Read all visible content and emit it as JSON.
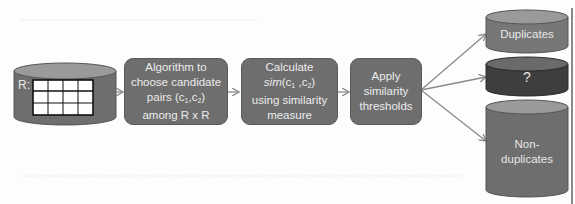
{
  "diagram": {
    "type": "flowchart",
    "colors": {
      "box_fill": "#6e6e6e",
      "cylinder_fill": "#6e6e6e",
      "cylinder_top": "#9a9a9a",
      "unknown_cylinder_fill": "#3e3e3e",
      "arrow": "#8a8a8a",
      "text": "#ececec"
    },
    "source": {
      "label": "R:",
      "grid_columns": 4,
      "grid_rows": 3
    },
    "steps": [
      {
        "id": "candidate-pairs",
        "lines": [
          "Algorithm to",
          "choose candidate",
          "pairs (c1,c2)",
          "among R x R"
        ]
      },
      {
        "id": "calculate-sim",
        "lines": [
          "Calculate",
          "sim(c1 ,c2)",
          "using similarity",
          "measure"
        ]
      },
      {
        "id": "apply-thresholds",
        "lines": [
          "Apply",
          "similarity",
          "thresholds"
        ]
      }
    ],
    "outputs": [
      {
        "id": "duplicates",
        "label": "Duplicates"
      },
      {
        "id": "unknown",
        "label": "?"
      },
      {
        "id": "non-duplicates",
        "label_lines": [
          "Non-",
          "duplicates"
        ]
      }
    ]
  }
}
